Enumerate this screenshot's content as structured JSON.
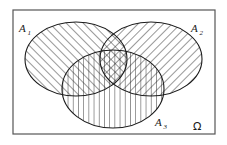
{
  "figure": {
    "kind": "venn-diagram",
    "background_color": "#ffffff",
    "stroke_color": "#1a1a1a",
    "frame_color": "#555555"
  },
  "frame": {
    "name": "sample-space-rectangle",
    "x": 13,
    "y": 10,
    "width": 202,
    "height": 124,
    "stroke_width": 1.2
  },
  "sets": [
    {
      "id": "A1",
      "label": "A",
      "subscript": "1",
      "hatch": "forward-slash",
      "hatch_angle_deg": 45,
      "cx": 76,
      "cy": 59,
      "rx": 51,
      "ry": 37,
      "label_x": 19,
      "label_y": 32
    },
    {
      "id": "A2",
      "label": "A",
      "subscript": "2",
      "hatch": "back-slash",
      "hatch_angle_deg": -45,
      "cx": 151,
      "cy": 59,
      "rx": 51,
      "ry": 37,
      "label_x": 196,
      "label_y": 32
    },
    {
      "id": "A3",
      "label": "A",
      "subscript": "3",
      "hatch": "vertical",
      "hatch_angle_deg": 90,
      "cx": 113,
      "cy": 89,
      "rx": 51,
      "ry": 39,
      "label_x": 158,
      "label_y": 126
    }
  ],
  "universe": {
    "id": "Omega",
    "label": "Ω",
    "label_x": 196,
    "label_y": 129
  },
  "hatching": {
    "spacing_px": 6,
    "line_width": 0.9,
    "color": "#1a1a1a"
  }
}
